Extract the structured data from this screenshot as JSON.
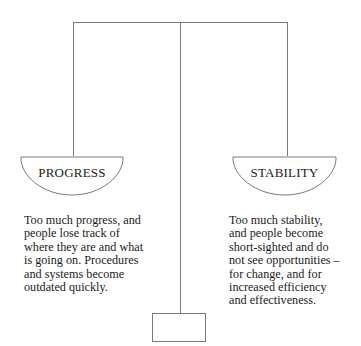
{
  "diagram": {
    "type": "balance-scale",
    "left_pan": {
      "label": "PROGRESS",
      "description": "Too much progress, and\npeople lose track of\nwhere they are and what\nis going on. Procedures\nand systems become\noutdated quickly."
    },
    "right_pan": {
      "label": "STABILITY",
      "description": "Too much stability,\nand people become\nshort-sighted and do\nnot see opportunities –\nfor change, and for\nincreased efficiency\nand effectiveness."
    },
    "line_color": "#7a7a7a"
  }
}
